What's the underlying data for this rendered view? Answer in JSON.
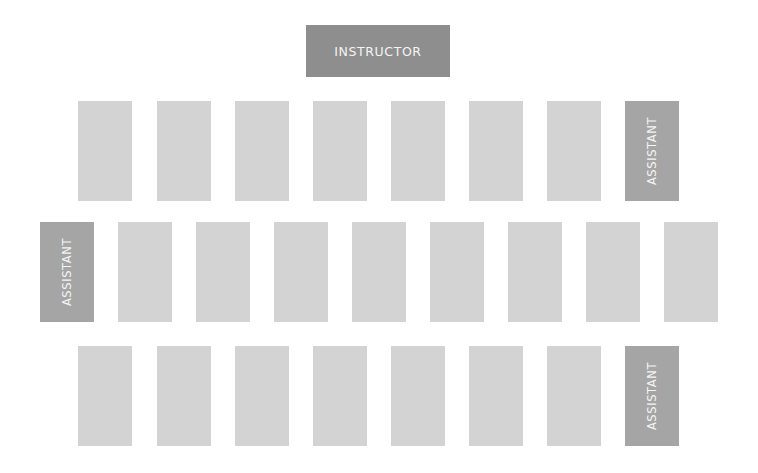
{
  "diagram": {
    "colors": {
      "background": "#ffffff",
      "instructor": "#8e8e8e",
      "assistant": "#a5a5a5",
      "seat": "#d3d3d3",
      "label_text": "#f4f4f4"
    },
    "instructor": {
      "label": "INSTRUCTOR"
    },
    "rows": [
      {
        "name": "row-1",
        "top": 101,
        "seats": [
          {
            "role": "seat",
            "label": "",
            "x": 78
          },
          {
            "role": "seat",
            "label": "",
            "x": 157
          },
          {
            "role": "seat",
            "label": "",
            "x": 235
          },
          {
            "role": "seat",
            "label": "",
            "x": 313
          },
          {
            "role": "seat",
            "label": "",
            "x": 391
          },
          {
            "role": "seat",
            "label": "",
            "x": 469
          },
          {
            "role": "seat",
            "label": "",
            "x": 547
          },
          {
            "role": "assistant",
            "label": "ASSISTANT",
            "x": 625
          }
        ]
      },
      {
        "name": "row-2",
        "top": 222,
        "seats": [
          {
            "role": "assistant",
            "label": "ASSISTANT",
            "x": 40
          },
          {
            "role": "seat",
            "label": "",
            "x": 118
          },
          {
            "role": "seat",
            "label": "",
            "x": 196
          },
          {
            "role": "seat",
            "label": "",
            "x": 274
          },
          {
            "role": "seat",
            "label": "",
            "x": 352
          },
          {
            "role": "seat",
            "label": "",
            "x": 430
          },
          {
            "role": "seat",
            "label": "",
            "x": 508
          },
          {
            "role": "seat",
            "label": "",
            "x": 586
          },
          {
            "role": "seat",
            "label": "",
            "x": 664
          }
        ]
      },
      {
        "name": "row-3",
        "top": 346,
        "seats": [
          {
            "role": "seat",
            "label": "",
            "x": 78
          },
          {
            "role": "seat",
            "label": "",
            "x": 157
          },
          {
            "role": "seat",
            "label": "",
            "x": 235
          },
          {
            "role": "seat",
            "label": "",
            "x": 313
          },
          {
            "role": "seat",
            "label": "",
            "x": 391
          },
          {
            "role": "seat",
            "label": "",
            "x": 469
          },
          {
            "role": "seat",
            "label": "",
            "x": 547
          },
          {
            "role": "assistant",
            "label": "ASSISTANT",
            "x": 625
          }
        ]
      }
    ]
  }
}
